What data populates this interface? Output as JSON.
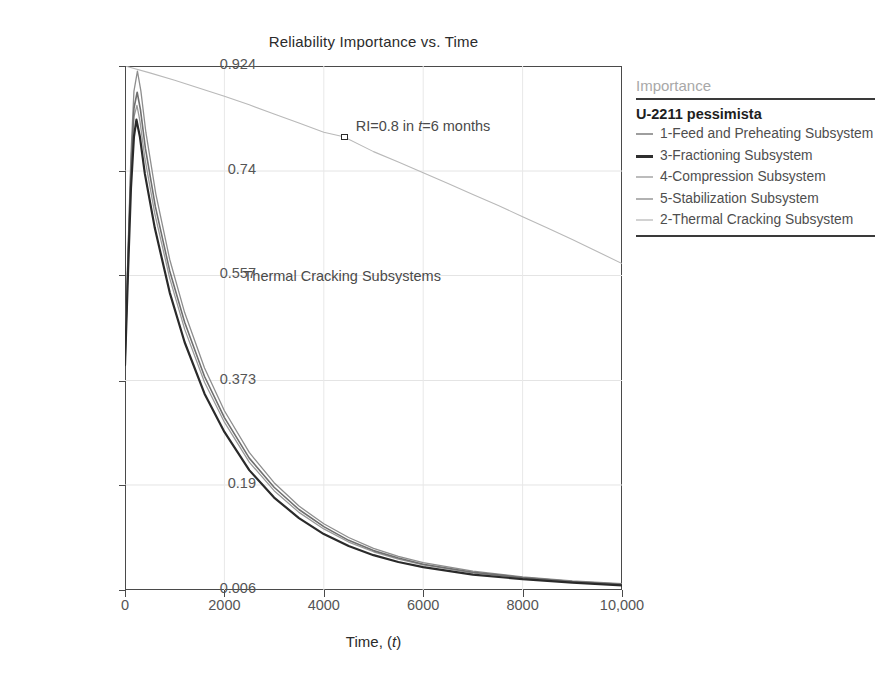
{
  "chart_data": {
    "type": "line",
    "title": "Reliability Importance vs. Time",
    "xlabel": "Time, (t)",
    "ylabel": "Reliability Importance Value",
    "xlim": [
      0,
      10000
    ],
    "ylim": [
      0.006,
      0.924
    ],
    "grid": true,
    "legend_position": "right",
    "xticks": [
      "0",
      "2000",
      "4000",
      "6000",
      "8000",
      "10,000"
    ],
    "xtick_values": [
      0,
      2000,
      4000,
      6000,
      8000,
      10000
    ],
    "yticks": [
      "0.924",
      "0.74",
      "0.557",
      "0.373",
      "0.19",
      "0.006"
    ],
    "ytick_values": [
      0.924,
      0.74,
      0.557,
      0.373,
      0.19,
      0.006
    ],
    "annotations": [
      {
        "name": "ri-callout",
        "text_before": "RI=0.8 in ",
        "text_italic": "t",
        "text_after": "=6 months",
        "x": 4400,
        "y": 0.8
      },
      {
        "name": "thermal-cracking-label",
        "text": "Thermal Cracking Subsystems",
        "x": 5100,
        "y": 0.555
      }
    ],
    "series": [
      {
        "name": "1-Feed and Preheating Subsystem",
        "color": "#b9b9b9",
        "width": 1.1,
        "x": [
          0,
          500,
          1000,
          1500,
          2000,
          2500,
          3000,
          3500,
          4000,
          4400,
          5000,
          5500,
          6000,
          6500,
          7000,
          7500,
          8000,
          8500,
          9000,
          9500,
          10000
        ],
        "y": [
          0.924,
          0.912,
          0.899,
          0.885,
          0.871,
          0.856,
          0.84,
          0.824,
          0.808,
          0.8,
          0.774,
          0.756,
          0.737,
          0.718,
          0.699,
          0.68,
          0.66,
          0.64,
          0.62,
          0.599,
          0.578
        ]
      },
      {
        "name": "3-Fractioning Subsystem",
        "color": "#2a2a2a",
        "width": 2.2,
        "x": [
          0,
          60,
          120,
          180,
          230,
          300,
          400,
          600,
          900,
          1200,
          1600,
          2000,
          2500,
          3000,
          3500,
          4000,
          4500,
          5000,
          5500,
          6000,
          7000,
          8000,
          9000,
          10000
        ],
        "y": [
          0.4,
          0.56,
          0.71,
          0.8,
          0.83,
          0.8,
          0.735,
          0.64,
          0.527,
          0.44,
          0.35,
          0.283,
          0.216,
          0.168,
          0.132,
          0.104,
          0.083,
          0.067,
          0.055,
          0.046,
          0.033,
          0.025,
          0.019,
          0.014
        ]
      },
      {
        "name": "4-Compression Subsystem",
        "color": "#9a9a9a",
        "width": 1.3,
        "x": [
          0,
          60,
          120,
          180,
          240,
          300,
          400,
          600,
          900,
          1200,
          1600,
          2000,
          2500,
          3000,
          3500,
          4000,
          4500,
          5000,
          5500,
          6000,
          7000,
          8000,
          9000,
          10000
        ],
        "y": [
          0.405,
          0.575,
          0.73,
          0.835,
          0.855,
          0.828,
          0.762,
          0.665,
          0.552,
          0.463,
          0.37,
          0.3,
          0.23,
          0.18,
          0.142,
          0.113,
          0.09,
          0.073,
          0.06,
          0.05,
          0.036,
          0.027,
          0.02,
          0.015
        ]
      },
      {
        "name": "5-Stabilization Subsystem",
        "color": "#8e8e8e",
        "width": 1.3,
        "x": [
          0,
          60,
          120,
          180,
          250,
          320,
          420,
          620,
          900,
          1200,
          1600,
          2000,
          2500,
          3000,
          3500,
          4000,
          4500,
          5000,
          5500,
          6000,
          7000,
          8000,
          9000,
          10000
        ],
        "y": [
          0.41,
          0.6,
          0.77,
          0.88,
          0.915,
          0.88,
          0.808,
          0.7,
          0.585,
          0.492,
          0.395,
          0.32,
          0.247,
          0.194,
          0.153,
          0.122,
          0.098,
          0.079,
          0.065,
          0.054,
          0.039,
          0.029,
          0.022,
          0.017
        ]
      },
      {
        "name": "2-Thermal Cracking Subsystem",
        "color": "#6f6f6f",
        "width": 1.6,
        "x": [
          0,
          60,
          120,
          180,
          245,
          310,
          410,
          610,
          900,
          1200,
          1600,
          2000,
          2500,
          3000,
          3500,
          4000,
          4500,
          5000,
          5500,
          6000,
          7000,
          8000,
          9000,
          10000
        ],
        "y": [
          0.402,
          0.585,
          0.745,
          0.85,
          0.878,
          0.848,
          0.78,
          0.678,
          0.565,
          0.475,
          0.38,
          0.308,
          0.237,
          0.186,
          0.147,
          0.117,
          0.093,
          0.075,
          0.062,
          0.051,
          0.037,
          0.028,
          0.021,
          0.016
        ]
      }
    ]
  },
  "legend": {
    "heading": "Importance",
    "subtitle": "U-2211 pessimista",
    "items": [
      {
        "label": "1-Feed and Preheating Subsystem",
        "color": "#9e9e9e",
        "width": 2
      },
      {
        "label": "3-Fractioning Subsystem",
        "color": "#2e2e2e",
        "width": 3.2
      },
      {
        "label": "4-Compression Subsystem",
        "color": "#bcbcbc",
        "width": 2
      },
      {
        "label": "5-Stabilization Subsystem",
        "color": "#b2b2b2",
        "width": 2
      },
      {
        "label": "2-Thermal Cracking Subsystem",
        "color": "#d2d2d2",
        "width": 2
      }
    ]
  }
}
